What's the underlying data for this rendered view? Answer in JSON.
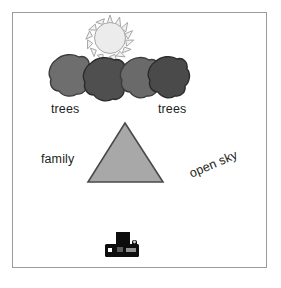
{
  "scene": {
    "title": "photo-composition-sketch",
    "background_color": "#ffffff",
    "frame_color": "#9a9a9a",
    "labels": {
      "trees_left": "trees",
      "trees_right": "trees",
      "family": "family",
      "open_sky": "open sky"
    },
    "text_color": "#231f20",
    "open_sky_rotation_deg": -23,
    "sun": {
      "name": "sun",
      "fill": "#ececec",
      "stroke": "#a7a7a7",
      "cx": 110,
      "cy": 38,
      "r": 15,
      "ray_count": 15,
      "ray_length": 7
    },
    "trees": [
      {
        "name": "tree-blob-1",
        "fill": "#6e6e6e",
        "stroke": "#3c3c3c",
        "cx": 68,
        "cy": 78
      },
      {
        "name": "tree-blob-2",
        "fill": "#4f4f4f",
        "stroke": "#2b2b2b",
        "cx": 103,
        "cy": 82
      },
      {
        "name": "tree-blob-3",
        "fill": "#6a6a6a",
        "stroke": "#3c3c3c",
        "cx": 137,
        "cy": 79
      },
      {
        "name": "tree-blob-4",
        "fill": "#4a4a4a",
        "stroke": "#2b2b2b",
        "cx": 166,
        "cy": 79
      }
    ],
    "triangle": {
      "name": "family-triangle",
      "fill": "#a8a8a8",
      "stroke": "#4a4a4a",
      "apex_x": 125,
      "apex_y": 123,
      "base_left_x": 88,
      "base_right_x": 163,
      "base_y": 182
    },
    "camera": {
      "name": "camera",
      "fill": "#0d0d0d",
      "x": 105,
      "y": 233,
      "width": 36,
      "height": 24
    }
  }
}
